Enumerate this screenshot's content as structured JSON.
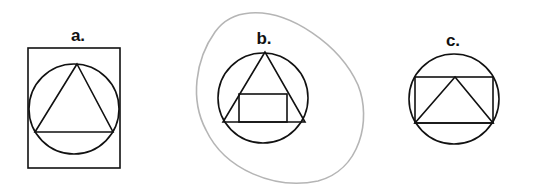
{
  "figures": [
    {
      "id": "a",
      "label": "a.",
      "description": "Triangle inscribed in circle, circle inscribed in rectangle"
    },
    {
      "id": "b",
      "label": "b.",
      "description": "Rectangle inscribed in triangle inscribed in circle, surrounded by irregular blob outline"
    },
    {
      "id": "c",
      "label": "c.",
      "description": "Triangle inscribed in rectangle inscribed in circle"
    }
  ],
  "colors": {
    "ink": "#111111",
    "blob": "#b5b5b5",
    "background": "#ffffff"
  }
}
